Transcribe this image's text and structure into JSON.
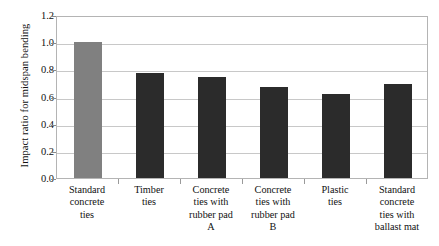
{
  "chart_data": {
    "type": "bar",
    "title": "",
    "xlabel": "",
    "ylabel": "Impact ratio for midspan bending",
    "ylim": [
      0.0,
      1.2
    ],
    "ytick_labels": [
      "1.2",
      "1.0",
      "0.8",
      "0.6",
      "0.4",
      "0.2",
      "0.0"
    ],
    "ytick_values": [
      1.2,
      1.0,
      0.8,
      0.6,
      0.4,
      0.2,
      0.0
    ],
    "grid": "horizontal",
    "legend": "none",
    "categories": [
      "Standard concrete ties",
      "Timber ties",
      "Concrete ties with rubber pad A",
      "Concrete ties with rubber pad B",
      "Plastic ties",
      "Standard concrete ties with ballast mat"
    ],
    "category_lines": [
      [
        "Standard",
        "concrete",
        "ties"
      ],
      [
        "Timber",
        "ties"
      ],
      [
        "Concrete",
        "ties with",
        "rubber pad",
        "A"
      ],
      [
        "Concrete",
        "ties with",
        "rubber pad",
        "B"
      ],
      [
        "Plastic",
        "ties"
      ],
      [
        "Standard",
        "concrete",
        "ties with",
        "ballast mat"
      ]
    ],
    "values": [
      1.0,
      0.77,
      0.74,
      0.67,
      0.62,
      0.69
    ],
    "bar_colors": [
      "#808080",
      "#2b2b2b",
      "#2b2b2b",
      "#2b2b2b",
      "#2b2b2b",
      "#2b2b2b"
    ]
  },
  "colors": {
    "highlight_bar": "#808080",
    "standard_bar": "#2b2b2b",
    "gridline": "#c8c8c8",
    "frame": "#b4b4b4",
    "text": "#111111",
    "background": "#ffffff"
  }
}
